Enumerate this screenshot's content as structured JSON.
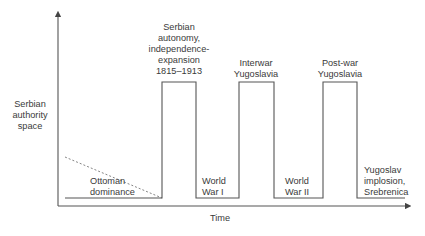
{
  "diagram": {
    "y_axis_label": [
      "Serbian",
      "authority",
      "space"
    ],
    "x_axis_label": "Time",
    "colors": {
      "line": "#555555",
      "text": "#3a3a3a",
      "background": "#ffffff"
    },
    "phases": [
      {
        "label": [
          "Ottoman",
          "dominance"
        ],
        "level": "low",
        "style": "dashed-decline"
      },
      {
        "label": [
          "Serbian",
          "autonomy,",
          "independence-",
          "expansion",
          "1815–1913"
        ],
        "level": "high"
      },
      {
        "label": [
          "World",
          "War I"
        ],
        "level": "low"
      },
      {
        "label": [
          "Interwar",
          "Yugoslavia"
        ],
        "level": "high"
      },
      {
        "label": [
          "World",
          "War II"
        ],
        "level": "low"
      },
      {
        "label": [
          "Post-war",
          "Yugoslavia"
        ],
        "level": "high"
      },
      {
        "label": [
          "Yugoslav",
          "implosion,",
          "Srebrenica"
        ],
        "level": "low"
      }
    ]
  }
}
